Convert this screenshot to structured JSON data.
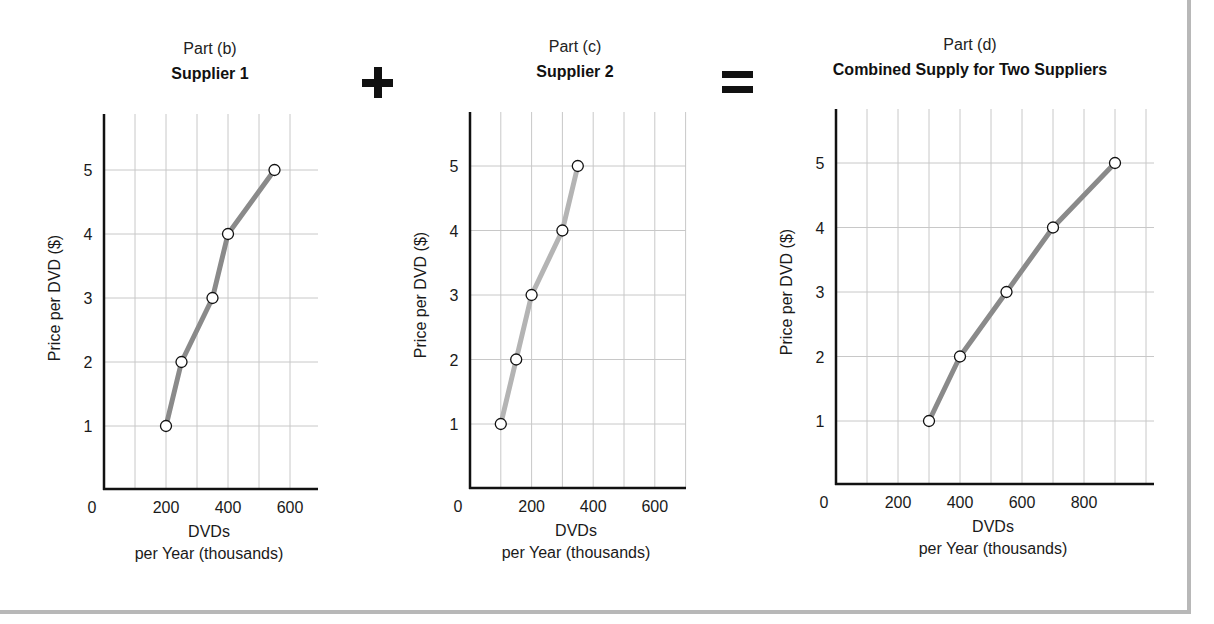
{
  "panels": [
    {
      "part_label": "Part (b)",
      "title": "Supplier 1",
      "ylabel": "Price per DVD ($)",
      "xlabel_line1": "DVDs",
      "xlabel_line2": "per Year (thousands)",
      "x_tick_labels": [
        "0",
        "200",
        "400",
        "600"
      ],
      "y_tick_labels": [
        "1",
        "2",
        "3",
        "4",
        "5"
      ]
    },
    {
      "part_label": "Part (c)",
      "title": "Supplier 2",
      "ylabel": "Price per DVD ($)",
      "xlabel_line1": "DVDs",
      "xlabel_line2": "per Year (thousands)",
      "x_tick_labels": [
        "0",
        "200",
        "400",
        "600"
      ],
      "y_tick_labels": [
        "1",
        "2",
        "3",
        "4",
        "5"
      ]
    },
    {
      "part_label": "Part (d)",
      "title": "Combined Supply for Two Suppliers",
      "ylabel": "Price per DVD ($)",
      "xlabel_line1": "DVDs",
      "xlabel_line2": "per Year (thousands)",
      "x_tick_labels": [
        "0",
        "200",
        "400",
        "600",
        "800"
      ],
      "y_tick_labels": [
        "1",
        "2",
        "3",
        "4",
        "5"
      ]
    }
  ],
  "operators": {
    "plus": "+",
    "equals": "="
  },
  "colors": {
    "line_dark": "#8a8a8a",
    "line_light": "#b4b4b4",
    "grid": "#c8c8c8",
    "axis": "#111111",
    "frame": "#b8b8b8"
  },
  "chart_data": [
    {
      "type": "line",
      "title": "Part (b) Supplier 1",
      "xlabel": "DVDs per Year (thousands)",
      "ylabel": "Price per DVD ($)",
      "x": [
        200,
        250,
        350,
        400,
        550
      ],
      "y": [
        1,
        2,
        3,
        4,
        5
      ],
      "xlim": [
        0,
        700
      ],
      "ylim": [
        0,
        5.8
      ],
      "x_ticks": [
        0,
        200,
        400,
        600
      ],
      "y_ticks": [
        1,
        2,
        3,
        4,
        5
      ],
      "grid": true,
      "markers": "open-circle"
    },
    {
      "type": "line",
      "title": "Part (c) Supplier 2",
      "xlabel": "DVDs per Year (thousands)",
      "ylabel": "Price per DVD ($)",
      "x": [
        100,
        150,
        200,
        300,
        350
      ],
      "y": [
        1,
        2,
        3,
        4,
        5
      ],
      "xlim": [
        0,
        700
      ],
      "ylim": [
        0,
        5.8
      ],
      "x_ticks": [
        0,
        200,
        400,
        600
      ],
      "y_ticks": [
        1,
        2,
        3,
        4,
        5
      ],
      "grid": true,
      "markers": "open-circle"
    },
    {
      "type": "line",
      "title": "Part (d) Combined Supply for Two Suppliers",
      "xlabel": "DVDs per Year (thousands)",
      "ylabel": "Price per DVD ($)",
      "x": [
        300,
        400,
        550,
        700,
        900
      ],
      "y": [
        1,
        2,
        3,
        4,
        5
      ],
      "xlim": [
        0,
        1000
      ],
      "ylim": [
        0,
        5.8
      ],
      "x_ticks": [
        0,
        200,
        400,
        600,
        800
      ],
      "y_ticks": [
        1,
        2,
        3,
        4,
        5
      ],
      "grid": true,
      "markers": "open-circle"
    }
  ]
}
